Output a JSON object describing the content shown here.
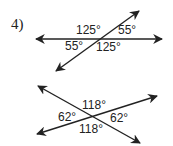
{
  "problem": {
    "number": "4)"
  },
  "figures": [
    {
      "name": "figure-top",
      "lines": [
        {
          "x1": 36,
          "y1": 39,
          "x2": 162,
          "y2": 39
        },
        {
          "x1": 139,
          "y1": 11,
          "x2": 56,
          "y2": 71
        }
      ],
      "angles": [
        {
          "label": "125°",
          "x": 76,
          "y": 34
        },
        {
          "label": "55°",
          "x": 118,
          "y": 34
        },
        {
          "label": "55°",
          "x": 65,
          "y": 50
        },
        {
          "label": "125°",
          "x": 96,
          "y": 51
        }
      ]
    },
    {
      "name": "figure-bottom",
      "lines": [
        {
          "x1": 38,
          "y1": 86,
          "x2": 140,
          "y2": 143
        },
        {
          "x1": 37,
          "y1": 134,
          "x2": 157,
          "y2": 96
        }
      ],
      "angles": [
        {
          "label": "118°",
          "x": 82,
          "y": 109
        },
        {
          "label": "62°",
          "x": 58,
          "y": 121
        },
        {
          "label": "62°",
          "x": 110,
          "y": 122
        },
        {
          "label": "118°",
          "x": 79,
          "y": 133
        }
      ]
    }
  ],
  "colors": {
    "stroke": "#222222",
    "text": "#222222",
    "background": "#ffffff"
  }
}
